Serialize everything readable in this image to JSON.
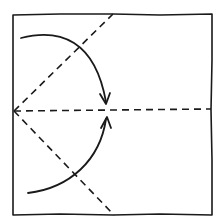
{
  "diagram": {
    "paper": {
      "shape": "square",
      "edge_color": "#1a1a1a",
      "background": "#ffffff"
    },
    "fold_lines": [
      {
        "id": "horizontal-center-crease",
        "type": "valley (dashed)"
      },
      {
        "id": "upper-diagonal-crease",
        "type": "valley (dashed)"
      },
      {
        "id": "lower-diagonal-crease",
        "type": "valley (dashed)"
      }
    ],
    "arrows": [
      {
        "id": "upper-fold-arrow",
        "meaning": "fold top-left edge down to center line"
      },
      {
        "id": "lower-fold-arrow",
        "meaning": "fold bottom-left edge up to center line"
      }
    ]
  }
}
